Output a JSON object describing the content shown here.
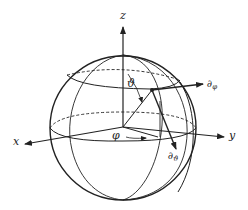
{
  "diagram": {
    "axes": {
      "x_label": "x",
      "y_label": "y",
      "z_label": "z"
    },
    "angles": {
      "polar_label": "ϑ",
      "azimuth_label": "φ"
    },
    "tangent_vectors": {
      "phi_symbol": "∂",
      "phi_subscript": "φ",
      "theta_symbol": "∂",
      "theta_subscript": "ϑ"
    },
    "colors": {
      "stroke": "#222222",
      "background": "#ffffff"
    }
  }
}
